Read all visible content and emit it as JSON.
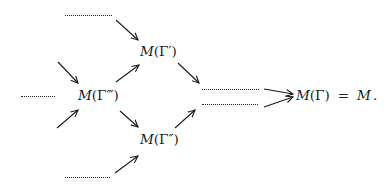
{
  "diagram": {
    "type": "commutative-diagram",
    "nodes": {
      "m_gamma_prime": {
        "M": "M",
        "arg": "(Γ′)"
      },
      "m_gamma_triple": {
        "M": "M",
        "arg": "(Γ‴)"
      },
      "m_gamma_double": {
        "M": "M",
        "arg": "(Γ″)"
      },
      "m_gamma": {
        "M": "M",
        "arg": "(Γ)",
        "equals": "=",
        "rhs": "M",
        "period": "."
      }
    },
    "placeholders": [
      {
        "id": "top-dots",
        "label": "……"
      },
      {
        "id": "left-dots",
        "label": "……"
      },
      {
        "id": "bottom-dots",
        "label": "……"
      },
      {
        "id": "right-upper-dots",
        "label": "……"
      },
      {
        "id": "right-lower-dots",
        "label": "……"
      }
    ],
    "edges": [
      {
        "from": "top-dots",
        "to": "M(Γ′)"
      },
      {
        "from": "(incoming upper-left)",
        "to": "M(Γ‴)"
      },
      {
        "from": "(incoming lower-left)",
        "to": "M(Γ‴)"
      },
      {
        "from": "M(Γ‴)",
        "to": "M(Γ′)"
      },
      {
        "from": "M(Γ‴)",
        "to": "M(Γ″)"
      },
      {
        "from": "bottom-dots",
        "to": "M(Γ″)"
      },
      {
        "from": "M(Γ′)",
        "to": "right-dots"
      },
      {
        "from": "M(Γ″)",
        "to": "right-dots"
      },
      {
        "from": "right-upper-dots",
        "to": "M(Γ)"
      },
      {
        "from": "right-lower-dots",
        "to": "M(Γ)"
      }
    ],
    "colors": {
      "ink": "#1a1a1a",
      "background": "#ffffff"
    }
  }
}
